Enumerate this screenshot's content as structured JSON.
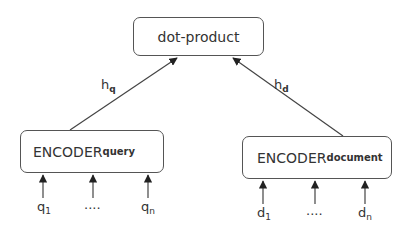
{
  "diagram": {
    "top_node": {
      "label": "dot-product"
    },
    "query_encoder": {
      "label": "ENCODER",
      "subscript": "query",
      "inputs": [
        {
          "base": "q",
          "sub": "1"
        },
        {
          "base": "....",
          "sub": ""
        },
        {
          "base": "q",
          "sub": "n"
        }
      ]
    },
    "document_encoder": {
      "label": "ENCODER",
      "subscript": "document",
      "inputs": [
        {
          "base": "d",
          "sub": "1"
        },
        {
          "base": "....",
          "sub": ""
        },
        {
          "base": "d",
          "sub": "n"
        }
      ]
    },
    "edges": [
      {
        "label_base": "h",
        "label_sub": "q",
        "from": "query_encoder",
        "to": "top_node"
      },
      {
        "label_base": "h",
        "label_sub": "d",
        "from": "document_encoder",
        "to": "top_node"
      }
    ]
  }
}
